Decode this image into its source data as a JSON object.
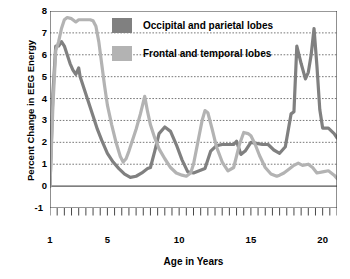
{
  "chart_data": {
    "type": "line",
    "title": "",
    "xlabel": "Age in Years",
    "ylabel": "Percent Change in EEG Energy",
    "xlim": [
      1,
      21
    ],
    "ylim": [
      -1,
      8
    ],
    "xticks": [
      1,
      5,
      10,
      15,
      20
    ],
    "yticks": [
      -1,
      0,
      1,
      2,
      3,
      4,
      5,
      6,
      7,
      8
    ],
    "xminor_step": 0.5,
    "grid": "horizontal-dotted",
    "legend_position": "top-center",
    "series": [
      {
        "name": "Occipital and parietal lobes",
        "color": "#808080",
        "x": [
          1.0,
          1.2,
          1.4,
          1.6,
          1.8,
          2.0,
          2.2,
          2.4,
          2.6,
          2.8,
          3.0,
          3.1,
          3.2,
          3.4,
          3.6,
          3.8,
          4.0,
          4.3,
          4.6,
          5.0,
          5.4,
          5.8,
          6.2,
          6.6,
          7.0,
          7.4,
          7.8,
          8.0,
          8.3,
          8.6,
          9.0,
          9.4,
          9.8,
          10.2,
          10.6,
          11.0,
          11.4,
          11.8,
          12.2,
          12.6,
          13.0,
          13.4,
          13.8,
          14.0,
          14.3,
          14.6,
          15.0,
          15.4,
          15.8,
          16.2,
          16.6,
          17.0,
          17.4,
          17.8,
          18.0,
          18.2,
          18.5,
          18.8,
          19.0,
          19.2,
          19.4,
          19.6,
          19.8,
          20.0,
          20.4,
          20.8,
          21.0
        ],
        "y": [
          0.0,
          4.2,
          6.4,
          6.4,
          6.6,
          6.4,
          6.0,
          5.6,
          5.3,
          5.1,
          5.4,
          5.0,
          4.8,
          4.4,
          4.0,
          3.6,
          3.2,
          2.6,
          2.1,
          1.5,
          1.1,
          0.8,
          0.55,
          0.4,
          0.45,
          0.6,
          0.8,
          0.85,
          1.6,
          2.4,
          2.7,
          2.5,
          1.9,
          1.2,
          0.65,
          0.6,
          0.7,
          0.8,
          1.6,
          1.85,
          1.9,
          1.9,
          1.9,
          2.05,
          1.45,
          1.6,
          2.0,
          1.95,
          1.9,
          1.9,
          1.65,
          1.5,
          1.8,
          3.3,
          3.4,
          6.4,
          5.6,
          4.9,
          5.2,
          6.0,
          7.2,
          5.5,
          3.5,
          2.65,
          2.65,
          2.4,
          2.2
        ]
      },
      {
        "name": "Frontal and temporal lobes",
        "color": "#b3b3b3",
        "x": [
          1.0,
          1.2,
          1.4,
          1.6,
          1.8,
          2.0,
          2.2,
          2.5,
          2.8,
          3.0,
          3.2,
          3.5,
          3.8,
          4.0,
          4.2,
          4.4,
          4.6,
          4.8,
          5.0,
          5.3,
          5.6,
          5.9,
          6.1,
          6.3,
          6.5,
          6.8,
          7.0,
          7.3,
          7.6,
          7.8,
          8.0,
          8.3,
          8.6,
          9.0,
          9.4,
          9.8,
          10.2,
          10.5,
          10.8,
          11.0,
          11.3,
          11.6,
          11.8,
          12.0,
          12.3,
          12.6,
          13.0,
          13.4,
          13.8,
          14.2,
          14.5,
          14.8,
          15.0,
          15.3,
          15.6,
          16.0,
          16.4,
          16.8,
          17.0,
          17.3,
          17.6,
          18.0,
          18.3,
          18.6,
          19.0,
          19.3,
          19.6,
          20.0,
          20.4,
          20.8,
          21.0
        ],
        "y": [
          0.0,
          3.6,
          6.2,
          6.6,
          7.2,
          7.6,
          7.7,
          7.65,
          7.5,
          7.6,
          7.6,
          7.6,
          7.6,
          7.55,
          7.3,
          6.6,
          5.6,
          4.6,
          3.7,
          2.8,
          2.0,
          1.35,
          1.1,
          1.25,
          1.6,
          2.2,
          2.6,
          3.3,
          4.1,
          3.4,
          2.8,
          2.2,
          1.7,
          1.25,
          0.85,
          0.6,
          0.5,
          0.45,
          0.6,
          1.0,
          2.0,
          3.0,
          3.45,
          3.35,
          2.6,
          1.8,
          1.1,
          0.7,
          0.85,
          1.9,
          2.45,
          2.4,
          2.3,
          1.9,
          1.4,
          0.85,
          0.55,
          0.45,
          0.5,
          0.6,
          0.75,
          0.95,
          1.05,
          0.95,
          1.0,
          0.85,
          0.6,
          0.65,
          0.7,
          0.5,
          0.35
        ]
      }
    ]
  },
  "legend": {
    "items": [
      {
        "label": "Occipital and parietal lobes",
        "color": "#808080"
      },
      {
        "label": "Frontal and temporal lobes",
        "color": "#b3b3b3"
      }
    ]
  },
  "axes": {
    "y_title": "Percent Change in EEG Energy",
    "x_title": "Age in Years",
    "y_labels": [
      "8",
      "7",
      "6",
      "5",
      "4",
      "3",
      "2",
      "1",
      "0",
      "-1"
    ],
    "x_labels": [
      "1",
      "5",
      "10",
      "15",
      "20"
    ]
  },
  "style": {
    "axis_color": "#333333",
    "grid_color": "#555555",
    "background": "#ffffff"
  }
}
